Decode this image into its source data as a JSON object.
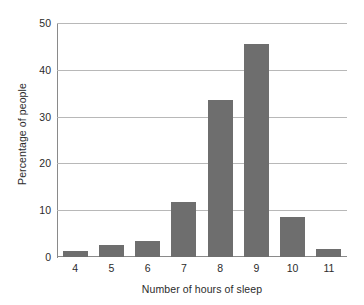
{
  "chart_data": {
    "type": "bar",
    "title": "",
    "xlabel": "Number of hours of sleep",
    "ylabel": "Percentage of people",
    "categories": [
      "4",
      "5",
      "6",
      "7",
      "8",
      "9",
      "10",
      "11"
    ],
    "values": [
      1.3,
      2.5,
      3.4,
      11.8,
      33.6,
      45.6,
      8.5,
      1.7
    ],
    "ylim": [
      0,
      50
    ],
    "y_ticks": [
      0,
      10,
      20,
      30,
      40,
      50
    ],
    "y_tick_labels": [
      "0",
      "10",
      "20",
      "30",
      "40",
      "50"
    ],
    "grid": true,
    "legend": "none",
    "bar_color": "#6e6e6e",
    "gridline_color": "#b8b8b8",
    "axis_color": "#8a8a8a",
    "background_color": "#ffffff",
    "text_color": "#2b2b2b"
  }
}
